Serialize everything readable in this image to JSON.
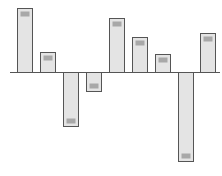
{
  "chart_data": {
    "type": "bar",
    "title": "",
    "xlabel": "",
    "ylabel": "",
    "categories": [
      "1",
      "2",
      "3",
      "4",
      "5",
      "6",
      "7",
      "8",
      "9"
    ],
    "values": [
      64,
      20,
      -54,
      -19,
      54,
      35,
      18,
      -89,
      39
    ],
    "ylim": [
      -100,
      70
    ],
    "grid": false,
    "legend": null,
    "style": {
      "bar_fill": "#e4e4e4",
      "bar_stroke": "#555555",
      "marker_fill": "#a8a8a8",
      "axis_color": "#555555"
    }
  },
  "layout": {
    "baseline_y": 72,
    "axis_x0": 10,
    "axis_x1": 220,
    "bar_x": [
      17,
      40,
      63,
      86,
      109,
      132,
      155,
      178,
      200
    ],
    "bar_width": 15
  }
}
